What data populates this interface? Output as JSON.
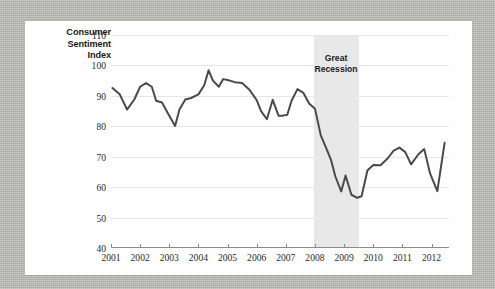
{
  "figure": {
    "y_axis_title_lines": [
      "Consumer",
      "Sentiment",
      "Index"
    ],
    "annotation_lines": [
      "Great",
      "Recession"
    ],
    "line_color": "#4a4a4a",
    "band_color": "#e8e8e8",
    "grid_color": "#e6e6e6",
    "axis_color": "#8c8c8c",
    "card_color": "#ffffff",
    "frame_color": "#b9b9b4"
  },
  "chart_data": {
    "type": "line",
    "title": "",
    "xlabel": "",
    "ylabel": "Consumer Sentiment Index",
    "ylim": [
      40,
      110
    ],
    "xlim": [
      2001.0,
      2012.6
    ],
    "yticks": [
      40,
      50,
      60,
      70,
      80,
      90,
      100,
      110
    ],
    "xticks": [
      2001,
      2002,
      2003,
      2004,
      2005,
      2006,
      2007,
      2008,
      2009,
      2010,
      2011,
      2012
    ],
    "grid": "horizontal",
    "legend": "none",
    "annotations": [
      {
        "text": "Great Recession",
        "type": "shaded-band",
        "x_start": 2007.95,
        "x_end": 2009.5,
        "color": "#e8e8e8"
      }
    ],
    "series": [
      {
        "name": "Consumer Sentiment Index",
        "color": "#4a4a4a",
        "x": [
          2001.05,
          2001.3,
          2001.55,
          2001.8,
          2002.0,
          2002.2,
          2002.4,
          2002.55,
          2002.75,
          2003.0,
          2003.2,
          2003.35,
          2003.55,
          2003.75,
          2004.0,
          2004.2,
          2004.35,
          2004.5,
          2004.7,
          2004.85,
          2005.0,
          2005.25,
          2005.5,
          2005.75,
          2006.0,
          2006.15,
          2006.35,
          2006.55,
          2006.75,
          2006.9,
          2007.05,
          2007.2,
          2007.4,
          2007.6,
          2007.8,
          2008.0,
          2008.2,
          2008.4,
          2008.55,
          2008.7,
          2008.9,
          2009.05,
          2009.25,
          2009.45,
          2009.6,
          2009.8,
          2010.0,
          2010.25,
          2010.5,
          2010.7,
          2010.9,
          2011.1,
          2011.3,
          2011.55,
          2011.75,
          2011.95,
          2012.2,
          2012.45
        ],
        "y": [
          92.6,
          90.5,
          85.5,
          88.8,
          93.0,
          94.2,
          93.0,
          88.4,
          87.8,
          83.5,
          80.1,
          85.5,
          88.8,
          89.3,
          90.5,
          93.5,
          98.4,
          95.0,
          93.0,
          95.5,
          95.2,
          94.5,
          94.2,
          92.0,
          88.6,
          85.0,
          82.3,
          88.7,
          83.5,
          83.5,
          83.8,
          88.5,
          92.2,
          91.0,
          87.5,
          85.8,
          77.0,
          72.5,
          69.0,
          63.5,
          58.6,
          63.8,
          57.5,
          56.5,
          57.0,
          65.5,
          67.3,
          67.2,
          69.5,
          72.0,
          73.0,
          71.5,
          67.5,
          70.8,
          72.5,
          64.5,
          58.7,
          74.6
        ]
      }
    ]
  }
}
